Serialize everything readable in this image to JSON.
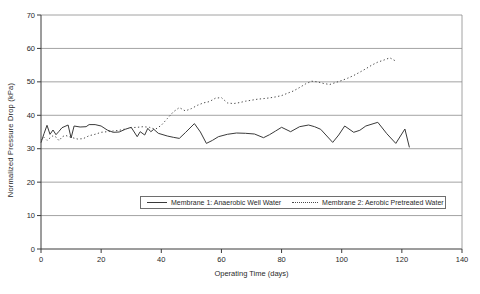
{
  "chart_data": {
    "type": "line",
    "title": "",
    "xlabel": "Operating Time (days)",
    "ylabel": "Normalized Pressure Drop (kPa)",
    "xlim": [
      0,
      140
    ],
    "ylim": [
      0,
      70
    ],
    "x_ticks": [
      0,
      20,
      40,
      60,
      80,
      100,
      120,
      140
    ],
    "y_ticks": [
      0,
      10,
      20,
      30,
      40,
      50,
      60,
      70
    ],
    "grid": "horizontal",
    "legend_position": "inside-bottom-center",
    "colors": {
      "line": "#3a3a3a",
      "dotted_line": "#4a4a4a",
      "gridline": "#8c8c8c",
      "axis": "#3a3a3a",
      "text": "#1f1f1f",
      "background": "#ffffff"
    },
    "series": [
      {
        "name": "Membrane 1: Anaerobic Well Water",
        "line_style": "solid",
        "points": [
          [
            0,
            31.8
          ],
          [
            1,
            34.5
          ],
          [
            2,
            37.0
          ],
          [
            3,
            34.3
          ],
          [
            4,
            35.6
          ],
          [
            5,
            34.2
          ],
          [
            6,
            35.2
          ],
          [
            7,
            36.3
          ],
          [
            9,
            37.1
          ],
          [
            10,
            33.2
          ],
          [
            11,
            36.8
          ],
          [
            13,
            36.5
          ],
          [
            15,
            36.6
          ],
          [
            16,
            37.2
          ],
          [
            18,
            37.2
          ],
          [
            20,
            36.8
          ],
          [
            22,
            35.6
          ],
          [
            24,
            34.9
          ],
          [
            26,
            35.0
          ],
          [
            28,
            35.8
          ],
          [
            30,
            36.4
          ],
          [
            32,
            33.6
          ],
          [
            33,
            35.1
          ],
          [
            34.5,
            34.1
          ],
          [
            35.5,
            36.1
          ],
          [
            36.5,
            35.1
          ],
          [
            37.5,
            35.8
          ],
          [
            39,
            34.6
          ],
          [
            42,
            33.8
          ],
          [
            44,
            33.4
          ],
          [
            46,
            33.1
          ],
          [
            48,
            34.8
          ],
          [
            51,
            37.5
          ],
          [
            53,
            35.0
          ],
          [
            55,
            31.6
          ],
          [
            57,
            32.5
          ],
          [
            59,
            33.6
          ],
          [
            62,
            34.3
          ],
          [
            65,
            34.7
          ],
          [
            68,
            34.6
          ],
          [
            71,
            34.4
          ],
          [
            74,
            33.3
          ],
          [
            76,
            34.2
          ],
          [
            78,
            35.3
          ],
          [
            80,
            36.4
          ],
          [
            83,
            35.1
          ],
          [
            86,
            36.6
          ],
          [
            89,
            37.1
          ],
          [
            91,
            36.6
          ],
          [
            93,
            35.8
          ],
          [
            97,
            31.9
          ],
          [
            99,
            34.1
          ],
          [
            101,
            36.8
          ],
          [
            104,
            34.9
          ],
          [
            106,
            35.5
          ],
          [
            108,
            36.8
          ],
          [
            112,
            37.9
          ],
          [
            115,
            34.5
          ],
          [
            118,
            31.6
          ],
          [
            121,
            35.9
          ],
          [
            122.5,
            30.4
          ]
        ]
      },
      {
        "name": "Membrane 2: Aerobic Pretreated Water",
        "line_style": "dotted",
        "points": [
          [
            0,
            32.6
          ],
          [
            1,
            33.4
          ],
          [
            2,
            32.5
          ],
          [
            3,
            33.2
          ],
          [
            4,
            33.9
          ],
          [
            5,
            33.5
          ],
          [
            6,
            32.4
          ],
          [
            7,
            33.5
          ],
          [
            8,
            34.0
          ],
          [
            10,
            33.4
          ],
          [
            12,
            32.9
          ],
          [
            14,
            33.0
          ],
          [
            16,
            33.9
          ],
          [
            18,
            34.3
          ],
          [
            20,
            34.9
          ],
          [
            22,
            35.1
          ],
          [
            24,
            35.3
          ],
          [
            26,
            35.5
          ],
          [
            28,
            35.9
          ],
          [
            30,
            36.3
          ],
          [
            32,
            36.4
          ],
          [
            34,
            36.6
          ],
          [
            36,
            36.4
          ],
          [
            38,
            35.8
          ],
          [
            40,
            37.0
          ],
          [
            42,
            39.0
          ],
          [
            44,
            41.0
          ],
          [
            46,
            42.3
          ],
          [
            48,
            41.3
          ],
          [
            50,
            42.0
          ],
          [
            52,
            43.0
          ],
          [
            54,
            43.7
          ],
          [
            56,
            44.1
          ],
          [
            58,
            45.1
          ],
          [
            60,
            45.3
          ],
          [
            62,
            43.7
          ],
          [
            64,
            43.5
          ],
          [
            66,
            43.8
          ],
          [
            68,
            44.2
          ],
          [
            70,
            44.5
          ],
          [
            72,
            44.8
          ],
          [
            74,
            45.0
          ],
          [
            76,
            45.2
          ],
          [
            78,
            45.5
          ],
          [
            80,
            45.9
          ],
          [
            82,
            46.6
          ],
          [
            84,
            47.3
          ],
          [
            86,
            48.3
          ],
          [
            88,
            49.4
          ],
          [
            90,
            50.2
          ],
          [
            92,
            50.0
          ],
          [
            94,
            49.5
          ],
          [
            96,
            49.2
          ],
          [
            98,
            49.8
          ],
          [
            100,
            50.4
          ],
          [
            102,
            51.1
          ],
          [
            104,
            51.9
          ],
          [
            106,
            52.9
          ],
          [
            108,
            53.9
          ],
          [
            110,
            55.0
          ],
          [
            112,
            55.9
          ],
          [
            114,
            56.5
          ],
          [
            116,
            57.2
          ],
          [
            118,
            56.2
          ]
        ]
      }
    ]
  }
}
